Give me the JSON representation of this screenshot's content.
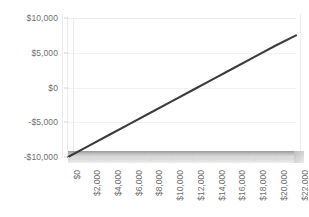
{
  "chart_data": {
    "type": "line",
    "title": "",
    "subtitle": "",
    "xlabel": "",
    "ylabel": "",
    "grid": true,
    "legend": false,
    "legend_position": "none",
    "style": "3d-line",
    "xlim": [
      0,
      22000
    ],
    "ylim": [
      -10000,
      10000
    ],
    "x_tick_labels": [
      "$0",
      "$2,000",
      "$4,000",
      "$6,000",
      "$8,000",
      "$10,000",
      "$12,000",
      "$14,000",
      "$16,000",
      "$18,000",
      "$20,000",
      "$22,000"
    ],
    "x_tick_values": [
      0,
      2000,
      4000,
      6000,
      8000,
      10000,
      12000,
      14000,
      16000,
      18000,
      20000,
      22000
    ],
    "y_tick_labels": [
      "$10,000",
      "$5,000",
      "$0",
      "-$5,000",
      "-$10,000"
    ],
    "y_tick_values": [
      10000,
      5000,
      0,
      -5000,
      -10000
    ],
    "series": [
      {
        "name": "Profit",
        "color": "#3c3c3c",
        "x": [
          0,
          2000,
          4000,
          6000,
          8000,
          10000,
          12000,
          14000,
          16000,
          18000,
          20000,
          22000
        ],
        "values": [
          -10000,
          -8400,
          -6800,
          -5200,
          -3600,
          -2000,
          -400,
          1200,
          2800,
          4400,
          6000,
          7500
        ]
      }
    ]
  },
  "axis": {
    "y_labels": [
      "$10,000",
      "$5,000",
      "$0",
      "-$5,000",
      "-$10,000"
    ],
    "x_labels": [
      "$0",
      "$2,000",
      "$4,000",
      "$6,000",
      "$8,000",
      "$10,000",
      "$12,000",
      "$14,000",
      "$16,000",
      "$18,000",
      "$20,000",
      "$22,000"
    ]
  },
  "colors": {
    "series_line": "#3c3c3c",
    "gridline": "#f2f2f2",
    "tick_text": "#6e6e6e",
    "floor_top": "#9a9a9a",
    "background": "#ffffff"
  }
}
